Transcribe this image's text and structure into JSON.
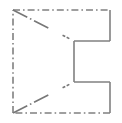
{
  "figure": {
    "canvas": {
      "width": 122,
      "height": 123,
      "background_color": "#ffffff"
    },
    "style": {
      "stroke_color": "#808080",
      "stroke_color_dark": "#777777",
      "stroke_width": 1.6,
      "dash_pattern": "7 3 1.6 3",
      "solid_pattern": "none"
    },
    "vertices": {
      "top_left": {
        "x": 13,
        "y": 10
      },
      "top_right": {
        "x": 110,
        "y": 10
      },
      "upper_notch_right": {
        "x": 110,
        "y": 41
      },
      "upper_notch_left": {
        "x": 74,
        "y": 41
      },
      "lower_notch_left": {
        "x": 74,
        "y": 82
      },
      "lower_notch_right": {
        "x": 110,
        "y": 82
      },
      "bottom_right": {
        "x": 110,
        "y": 113
      },
      "bottom_left": {
        "x": 13,
        "y": 113
      }
    },
    "segments": [
      {
        "name": "top-edge",
        "style": "dash-dot",
        "from": "top_left",
        "to": "top_right",
        "path": "M 13 10 L 110 10"
      },
      {
        "name": "right-upper-edge",
        "style": "solid",
        "from": "top_right",
        "to": "upper_notch_right",
        "path": "M 110 10 L 110 41"
      },
      {
        "name": "upper-notch-horizontal",
        "style": "solid",
        "from": "upper_notch_right",
        "to": "upper_notch_left",
        "path": "M 110 41 L 74 41"
      },
      {
        "name": "central-vertical",
        "style": "solid",
        "from": "upper_notch_left",
        "to": "lower_notch_left",
        "path": "M 74 41 L 74 82"
      },
      {
        "name": "lower-notch-horizontal",
        "style": "solid",
        "from": "lower_notch_left",
        "to": "lower_notch_right",
        "path": "M 74 82 L 110 82"
      },
      {
        "name": "right-lower-edge",
        "style": "solid",
        "from": "lower_notch_right",
        "to": "bottom_right",
        "path": "M 110 82 L 110 113"
      },
      {
        "name": "bottom-edge",
        "style": "dash-dot",
        "from": "bottom_right",
        "to": "bottom_left",
        "path": "M 110 113 L 13 113"
      },
      {
        "name": "left-edge",
        "style": "dash-dot",
        "from": "bottom_left",
        "to": "top_left",
        "path": "M 13 113 L 13 10"
      },
      {
        "name": "upper-diagonal",
        "style": "dash-dot",
        "from": "top_left",
        "to": "upper_notch_left",
        "path": "M 13 10 L 74 41"
      },
      {
        "name": "lower-diagonal",
        "style": "dash-dot",
        "from": "bottom_left",
        "to": "lower_notch_left",
        "path": "M 13 113 L 74 82"
      }
    ]
  }
}
